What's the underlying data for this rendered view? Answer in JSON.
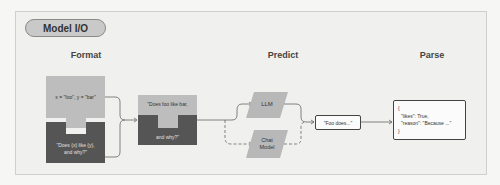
{
  "title": "Model I/O",
  "stages": {
    "format": "Format",
    "predict": "Predict",
    "parse": "Parse"
  },
  "format": {
    "variables": "x = \"foo\", y = \"bar\"",
    "template_line1": "\"Does {x} like {y},",
    "template_line2": "and why?\"",
    "prompt_line1": "\"Does foo like bar,",
    "prompt_line2": "and why?\""
  },
  "predict": {
    "llm": "LLM",
    "chat_model_line1": "Chat",
    "chat_model_line2": "Model",
    "output": "\"Foo does...\""
  },
  "parse": {
    "open_brace": "{",
    "line1": "\"likes\": True,",
    "line2": "\"reason\": \"Because ...\"",
    "close_brace": "}"
  },
  "colors": {
    "light_block": "#bdbdbd",
    "dark_block": "#555555",
    "model_block": "#b8b8b8",
    "line": "#666666"
  }
}
